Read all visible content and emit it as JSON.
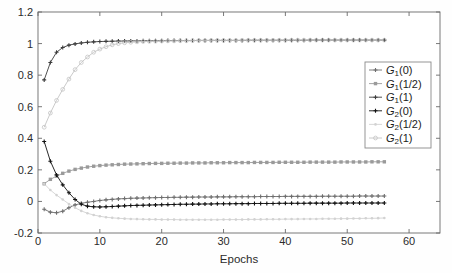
{
  "chart_data": {
    "type": "line",
    "title": "",
    "xlabel": "Epochs",
    "ylabel": "",
    "xlim": [
      0,
      65
    ],
    "ylim": [
      -0.2,
      1.2
    ],
    "xticks": [
      0,
      10,
      20,
      30,
      40,
      50,
      60
    ],
    "xtick_labels": [
      "0",
      "10",
      "20",
      "30",
      "40",
      "50",
      "60"
    ],
    "yticks": [
      -0.2,
      0,
      0.2,
      0.4,
      0.6,
      0.8,
      1,
      1.2
    ],
    "ytick_labels": [
      "-0.2",
      "0",
      "0.2",
      "0.4",
      "0.6",
      "0.8",
      "1",
      "1.2"
    ],
    "grid": false,
    "legend_position": "center-right",
    "x": [
      1,
      2,
      3,
      4,
      5,
      6,
      7,
      8,
      9,
      10,
      11,
      12,
      13,
      14,
      15,
      16,
      17,
      18,
      19,
      20,
      21,
      22,
      23,
      24,
      25,
      26,
      27,
      28,
      29,
      30,
      31,
      32,
      33,
      34,
      35,
      36,
      37,
      38,
      39,
      40,
      41,
      42,
      43,
      44,
      45,
      46,
      47,
      48,
      49,
      50,
      51,
      52,
      53,
      54,
      55,
      56
    ],
    "series": [
      {
        "name": "G_1(0)",
        "label_base": "G",
        "label_sub": "1",
        "label_arg": "(0)",
        "color": "#6e6e6e",
        "marker": "plus",
        "values": [
          -0.05,
          -0.068,
          -0.072,
          -0.062,
          -0.04,
          -0.022,
          -0.012,
          -0.005,
          0.0,
          0.006,
          0.01,
          0.013,
          0.016,
          0.018,
          0.02,
          0.021,
          0.022,
          0.023,
          0.024,
          0.025,
          0.025,
          0.026,
          0.026,
          0.027,
          0.027,
          0.028,
          0.028,
          0.028,
          0.029,
          0.029,
          0.029,
          0.03,
          0.03,
          0.03,
          0.03,
          0.031,
          0.031,
          0.031,
          0.031,
          0.032,
          0.032,
          0.032,
          0.032,
          0.032,
          0.032,
          0.033,
          0.033,
          0.033,
          0.033,
          0.033,
          0.033,
          0.034,
          0.034,
          0.034,
          0.034,
          0.034
        ]
      },
      {
        "name": "G_1(1/2)",
        "label_base": "G",
        "label_sub": "1",
        "label_arg": "(1/2)",
        "color": "#9a9a9a",
        "marker": "square",
        "values": [
          0.112,
          0.14,
          0.16,
          0.178,
          0.192,
          0.203,
          0.211,
          0.218,
          0.223,
          0.227,
          0.23,
          0.232,
          0.234,
          0.236,
          0.237,
          0.238,
          0.239,
          0.24,
          0.241,
          0.241,
          0.242,
          0.242,
          0.243,
          0.243,
          0.244,
          0.244,
          0.244,
          0.245,
          0.245,
          0.245,
          0.246,
          0.246,
          0.246,
          0.246,
          0.247,
          0.247,
          0.247,
          0.247,
          0.248,
          0.248,
          0.248,
          0.248,
          0.248,
          0.249,
          0.249,
          0.249,
          0.249,
          0.249,
          0.25,
          0.25,
          0.25,
          0.25,
          0.25,
          0.251,
          0.251,
          0.251
        ]
      },
      {
        "name": "G_1(1)",
        "label_base": "G",
        "label_sub": "1",
        "label_arg": "(1)",
        "color": "#3c3c3c",
        "marker": "plus",
        "values": [
          0.77,
          0.88,
          0.945,
          0.975,
          0.99,
          0.998,
          1.004,
          1.008,
          1.011,
          1.013,
          1.014,
          1.015,
          1.016,
          1.016,
          1.017,
          1.017,
          1.018,
          1.018,
          1.018,
          1.018,
          1.019,
          1.019,
          1.019,
          1.019,
          1.019,
          1.02,
          1.02,
          1.02,
          1.02,
          1.02,
          1.02,
          1.02,
          1.02,
          1.021,
          1.021,
          1.021,
          1.021,
          1.021,
          1.021,
          1.021,
          1.021,
          1.021,
          1.021,
          1.022,
          1.022,
          1.022,
          1.022,
          1.022,
          1.022,
          1.022,
          1.022,
          1.022,
          1.022,
          1.022,
          1.022,
          1.022
        ]
      },
      {
        "name": "G_2(0)",
        "label_base": "G",
        "label_sub": "2",
        "label_arg": "(0)",
        "color": "#111111",
        "marker": "plus",
        "values": [
          0.38,
          0.255,
          0.168,
          0.105,
          0.055,
          0.012,
          -0.018,
          -0.03,
          -0.034,
          -0.035,
          -0.034,
          -0.032,
          -0.03,
          -0.028,
          -0.026,
          -0.025,
          -0.024,
          -0.023,
          -0.022,
          -0.021,
          -0.02,
          -0.019,
          -0.018,
          -0.018,
          -0.017,
          -0.017,
          -0.016,
          -0.016,
          -0.015,
          -0.015,
          -0.015,
          -0.014,
          -0.014,
          -0.014,
          -0.013,
          -0.013,
          -0.013,
          -0.013,
          -0.012,
          -0.012,
          -0.012,
          -0.012,
          -0.012,
          -0.011,
          -0.011,
          -0.011,
          -0.011,
          -0.011,
          -0.011,
          -0.01,
          -0.01,
          -0.01,
          -0.01,
          -0.01,
          -0.01,
          -0.01
        ]
      },
      {
        "name": "G_2(1/2)",
        "label_base": "G",
        "label_sub": "2",
        "label_arg": "(1/2)",
        "color": "#d2d2d2",
        "marker": "dot",
        "values": [
          0.112,
          0.072,
          0.04,
          0.012,
          -0.016,
          -0.04,
          -0.06,
          -0.075,
          -0.086,
          -0.094,
          -0.1,
          -0.104,
          -0.107,
          -0.109,
          -0.111,
          -0.112,
          -0.113,
          -0.114,
          -0.114,
          -0.115,
          -0.115,
          -0.115,
          -0.116,
          -0.116,
          -0.116,
          -0.116,
          -0.116,
          -0.116,
          -0.116,
          -0.115,
          -0.115,
          -0.115,
          -0.115,
          -0.114,
          -0.114,
          -0.114,
          -0.113,
          -0.113,
          -0.113,
          -0.112,
          -0.112,
          -0.112,
          -0.111,
          -0.111,
          -0.111,
          -0.11,
          -0.11,
          -0.11,
          -0.109,
          -0.109,
          -0.108,
          -0.108,
          -0.107,
          -0.107,
          -0.106,
          -0.105
        ]
      },
      {
        "name": "G_2(1)",
        "label_base": "G",
        "label_sub": "2",
        "label_arg": "(1)",
        "color": "#c4c4c4",
        "marker": "circle",
        "values": [
          0.47,
          0.56,
          0.64,
          0.71,
          0.775,
          0.835,
          0.88,
          0.915,
          0.945,
          0.965,
          0.98,
          0.992,
          1.0,
          1.005,
          1.008,
          1.011,
          1.013,
          1.014,
          1.015,
          1.016,
          1.017,
          1.017,
          1.018,
          1.018,
          1.019,
          1.019,
          1.019,
          1.02,
          1.02,
          1.02,
          1.02,
          1.02,
          1.021,
          1.021,
          1.021,
          1.021,
          1.021,
          1.021,
          1.021,
          1.021,
          1.022,
          1.022,
          1.022,
          1.022,
          1.022,
          1.022,
          1.022,
          1.022,
          1.022,
          1.022,
          1.022,
          1.022,
          1.022,
          1.022,
          1.022,
          1.022
        ]
      }
    ]
  },
  "legend": {
    "entries": [
      {
        "base": "G",
        "sub": "1",
        "arg": "(0)"
      },
      {
        "base": "G",
        "sub": "1",
        "arg": "(1/2)"
      },
      {
        "base": "G",
        "sub": "1",
        "arg": "(1)"
      },
      {
        "base": "G",
        "sub": "2",
        "arg": "(0)"
      },
      {
        "base": "G",
        "sub": "2",
        "arg": "(1/2)"
      },
      {
        "base": "G",
        "sub": "2",
        "arg": "(1)"
      }
    ]
  },
  "colors": {
    "axis": "#6a6a6a",
    "text": "#2b2b2b",
    "background": "#fefefe",
    "legend_border": "#8a8a8a"
  }
}
